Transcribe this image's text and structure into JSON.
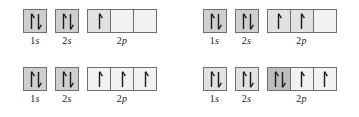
{
  "figure": {
    "kind": "orbital-filling-diagrams",
    "arrow_up_glyph": "up-arrow",
    "arrow_down_glyph": "down-arrow",
    "colors": {
      "box_border": "#6e6e6e",
      "box_fill_empty": "#f2f2f2",
      "box_fill_light": "#e2e2e2",
      "box_fill_medium": "#cfcfcf",
      "box_fill_dark": "#bdbdbd",
      "arrow": "#1a1a1a",
      "label_text": "#1a1a1a",
      "background": "#ffffff"
    }
  },
  "diagrams": [
    {
      "id": "diagram-top-left",
      "position": "top-left",
      "subshells": [
        {
          "label_number": "1",
          "label_letter": "s",
          "name": "1s",
          "boxes": [
            {
              "arrows": [
                "up",
                "down"
              ],
              "fill": "medium"
            }
          ]
        },
        {
          "label_number": "2",
          "label_letter": "s",
          "name": "2s",
          "boxes": [
            {
              "arrows": [
                "up",
                "down"
              ],
              "fill": "medium"
            }
          ]
        },
        {
          "label_number": "2",
          "label_letter": "p",
          "name": "2p",
          "boxes": [
            {
              "arrows": [
                "up"
              ],
              "fill": "light"
            },
            {
              "arrows": [],
              "fill": "empty"
            },
            {
              "arrows": [],
              "fill": "empty"
            }
          ]
        }
      ]
    },
    {
      "id": "diagram-top-right",
      "position": "top-right",
      "subshells": [
        {
          "label_number": "1",
          "label_letter": "s",
          "name": "1s",
          "boxes": [
            {
              "arrows": [
                "up",
                "down"
              ],
              "fill": "medium"
            }
          ]
        },
        {
          "label_number": "2",
          "label_letter": "s",
          "name": "2s",
          "boxes": [
            {
              "arrows": [
                "up",
                "down"
              ],
              "fill": "medium"
            }
          ]
        },
        {
          "label_number": "2",
          "label_letter": "p",
          "name": "2p",
          "boxes": [
            {
              "arrows": [
                "up"
              ],
              "fill": "light"
            },
            {
              "arrows": [
                "up"
              ],
              "fill": "light"
            },
            {
              "arrows": [],
              "fill": "empty"
            }
          ]
        }
      ]
    },
    {
      "id": "diagram-bottom-left",
      "position": "bottom-left",
      "subshells": [
        {
          "label_number": "1",
          "label_letter": "s",
          "name": "1s",
          "boxes": [
            {
              "arrows": [
                "up",
                "down"
              ],
              "fill": "medium"
            }
          ]
        },
        {
          "label_number": "2",
          "label_letter": "s",
          "name": "2s",
          "boxes": [
            {
              "arrows": [
                "up",
                "down"
              ],
              "fill": "medium"
            }
          ]
        },
        {
          "label_number": "2",
          "label_letter": "p",
          "name": "2p",
          "boxes": [
            {
              "arrows": [
                "up"
              ],
              "fill": "empty"
            },
            {
              "arrows": [
                "up"
              ],
              "fill": "empty"
            },
            {
              "arrows": [
                "up"
              ],
              "fill": "empty"
            }
          ]
        }
      ]
    },
    {
      "id": "diagram-bottom-right",
      "position": "bottom-right",
      "subshells": [
        {
          "label_number": "1",
          "label_letter": "s",
          "name": "1s",
          "boxes": [
            {
              "arrows": [
                "up",
                "down"
              ],
              "fill": "light"
            }
          ]
        },
        {
          "label_number": "2",
          "label_letter": "s",
          "name": "2s",
          "boxes": [
            {
              "arrows": [
                "up",
                "down"
              ],
              "fill": "light"
            }
          ]
        },
        {
          "label_number": "2",
          "label_letter": "p",
          "name": "2p",
          "boxes": [
            {
              "arrows": [
                "up",
                "down"
              ],
              "fill": "dark"
            },
            {
              "arrows": [
                "up"
              ],
              "fill": "empty"
            },
            {
              "arrows": [
                "up"
              ],
              "fill": "empty"
            }
          ]
        }
      ]
    }
  ]
}
